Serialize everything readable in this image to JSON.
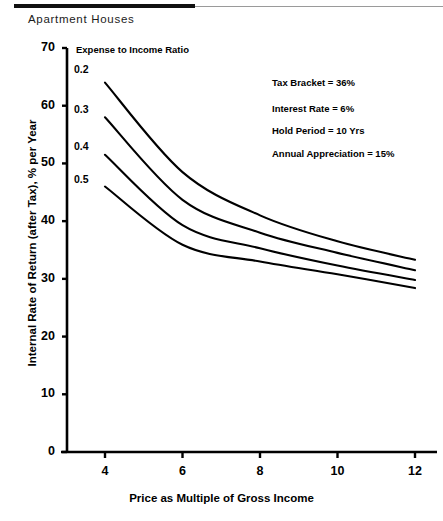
{
  "header": {
    "title": "Apartment Houses"
  },
  "chart_data": {
    "type": "line",
    "title": "Apartment Houses",
    "xlabel": "Price as Multiple of Gross Income",
    "ylabel": "Internal Rate of Return (after Tax), % per Year",
    "xlim": [
      3,
      13
    ],
    "ylim": [
      0,
      70
    ],
    "xticks": [
      4,
      6,
      8,
      10,
      12
    ],
    "yticks": [
      0,
      10,
      20,
      30,
      40,
      50,
      60,
      70
    ],
    "grid": false,
    "legend_title": "Expense to Income Ratio",
    "legend_position": "inside-plot-left",
    "x": [
      4,
      6,
      8,
      10,
      12
    ],
    "series": [
      {
        "name": "0.2",
        "values": [
          64.0,
          48.5,
          41.0,
          36.5,
          33.3
        ]
      },
      {
        "name": "0.3",
        "values": [
          58.0,
          43.7,
          38.0,
          34.5,
          31.5
        ]
      },
      {
        "name": "0.4",
        "values": [
          51.5,
          39.3,
          35.3,
          32.3,
          29.8
        ]
      },
      {
        "name": "0.5",
        "values": [
          46.0,
          35.9,
          33.0,
          30.8,
          28.4
        ]
      }
    ],
    "annotations": [
      "Tax Bracket = 36%",
      "Interest Rate = 6%",
      "Hold Period = 10 Yrs",
      "Annual Appreciation = 15%"
    ],
    "line_color": "#000000"
  }
}
